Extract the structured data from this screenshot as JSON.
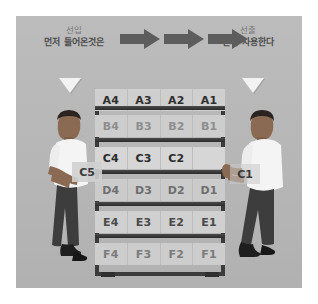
{
  "diagram": {
    "title_concept": "FIFO",
    "header": {
      "left": {
        "term": "선입",
        "description": "먼저 들어온것은"
      },
      "right": {
        "term": "선출",
        "description": "먼저 사용한다"
      }
    },
    "flow_arrows": [
      {
        "name": "flow-arrow-1",
        "direction": "right"
      },
      {
        "name": "flow-arrow-2",
        "direction": "right"
      },
      {
        "name": "flow-arrow-3",
        "direction": "right"
      }
    ],
    "markers": [
      {
        "name": "marker-left",
        "shape": "triangle-down"
      },
      {
        "name": "marker-right",
        "shape": "triangle-down"
      }
    ],
    "rack": {
      "rows": [
        {
          "id": "A",
          "slots": [
            "A4",
            "A3",
            "A2",
            "A1"
          ]
        },
        {
          "id": "B",
          "slots": [
            "B4",
            "B3",
            "B2",
            "B1"
          ]
        },
        {
          "id": "C",
          "slots": [
            "C4",
            "C3",
            "C2",
            ""
          ]
        },
        {
          "id": "D",
          "slots": [
            "D4",
            "D3",
            "D2",
            "D1"
          ]
        },
        {
          "id": "E",
          "slots": [
            "E4",
            "E3",
            "E2",
            "E1"
          ]
        },
        {
          "id": "F",
          "slots": [
            "F4",
            "F3",
            "F2",
            "F1"
          ]
        }
      ]
    },
    "workers": {
      "left": {
        "action": "inserting",
        "carried_label": "C5"
      },
      "right": {
        "action": "removing",
        "carried_label": "C1"
      }
    },
    "watermark": "",
    "colors": {
      "panel_bg": "#b9b9b9",
      "rack_frame": "#3b3b3b",
      "arrow": "#5d5d5d",
      "marker": "#f2f2f2",
      "slot_bg": "#d2d2d2",
      "shirt": "#f4f4f4",
      "pants": "#3d3d3d",
      "skin": "#8a6a52"
    }
  }
}
